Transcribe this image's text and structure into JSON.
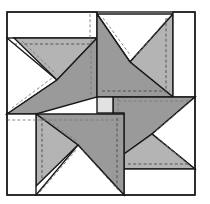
{
  "diagram": {
    "type": "quilt-block",
    "colors": {
      "background": "#ffffff",
      "white_fabric": "#ffffff",
      "dark_fabric": "#9a9a9a",
      "medium_fabric": "#b4b4b4",
      "center_square": "#e2e2e2",
      "cut_line": "#1a1a1a",
      "seam_line": "#4a4a4a"
    },
    "block": {
      "outer": {
        "x": 7,
        "y": 12,
        "w": 188,
        "h": 183
      },
      "white_rects": [
        {
          "name": "top-left-strip",
          "x": 7,
          "y": 12,
          "w": 90,
          "h": 26
        },
        {
          "name": "top-right-strip",
          "x": 173,
          "y": 12,
          "w": 22,
          "h": 85
        },
        {
          "name": "bottom-right-strip",
          "x": 124,
          "y": 169,
          "w": 71,
          "h": 26
        },
        {
          "name": "bottom-left-strip",
          "x": 7,
          "y": 114,
          "w": 29,
          "h": 81
        }
      ],
      "center_square": {
        "x": 97,
        "y": 97,
        "w": 16,
        "h": 16
      },
      "blades": [
        "top",
        "right",
        "bottom",
        "left"
      ]
    }
  }
}
